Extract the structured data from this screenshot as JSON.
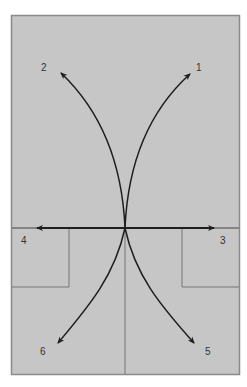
{
  "diagram": {
    "type": "movement-directions-field",
    "colors": {
      "page_background": "#ffffff",
      "field_fill": "#c6c6c6",
      "frame_stroke": "#8a8a8a",
      "box_stroke": "#777777",
      "arrow_stroke": "#1e1e1e",
      "label": "#333333"
    },
    "center": {
      "x": 125,
      "y": 228
    },
    "arrows": [
      {
        "id": "1",
        "label": "1",
        "direction": "forward-right",
        "tip": {
          "x": 190,
          "y": 74
        }
      },
      {
        "id": "2",
        "label": "2",
        "direction": "forward-left",
        "tip": {
          "x": 61,
          "y": 73
        }
      },
      {
        "id": "3",
        "label": "3",
        "direction": "right",
        "tip": {
          "x": 214,
          "y": 228
        }
      },
      {
        "id": "4",
        "label": "4",
        "direction": "left",
        "tip": {
          "x": 37,
          "y": 228
        }
      },
      {
        "id": "5",
        "label": "5",
        "direction": "back-right",
        "tip": {
          "x": 194,
          "y": 343
        }
      },
      {
        "id": "6",
        "label": "6",
        "direction": "back-left",
        "tip": {
          "x": 58,
          "y": 343
        }
      }
    ],
    "labels": {
      "one": "1",
      "two": "2",
      "three": "3",
      "four": "4",
      "five": "5",
      "six": "6"
    }
  }
}
